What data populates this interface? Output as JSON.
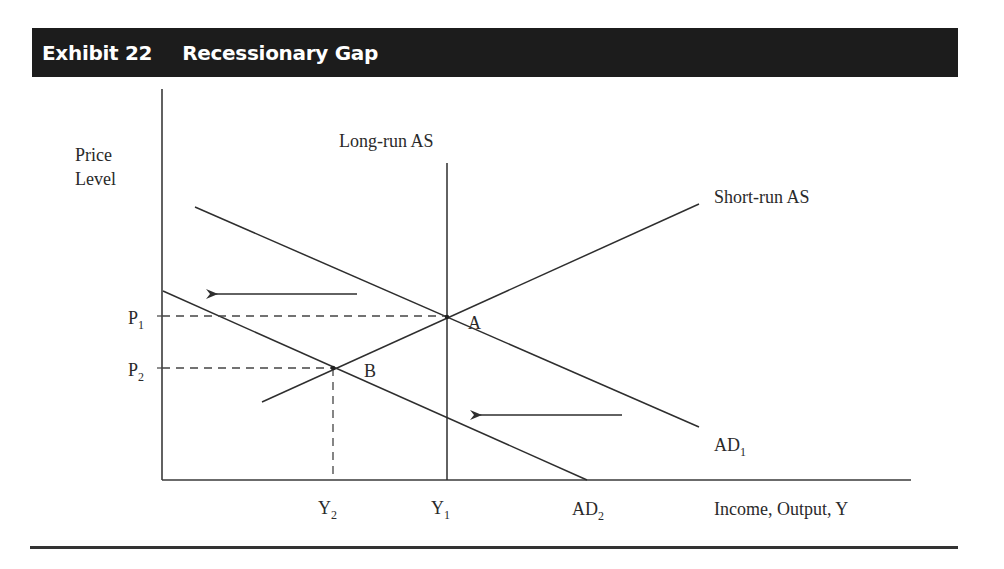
{
  "header": {
    "exhibit_label": "Exhibit 22",
    "title": "Recessionary Gap",
    "background_color": "#1c1c1c",
    "text_color": "#ffffff"
  },
  "axes": {
    "y_label_line1": "Price",
    "y_label_line2": "Level",
    "x_label": "Income, Output, Y"
  },
  "curves": {
    "lras_label": "Long-run AS",
    "sras_label": "Short-run AS",
    "ad1_label": "AD",
    "ad1_sub": "1",
    "ad2_label": "AD",
    "ad2_sub": "2"
  },
  "points": {
    "a_label": "A",
    "b_label": "B"
  },
  "ticks": {
    "p1": "P",
    "p1_sub": "1",
    "p2": "P",
    "p2_sub": "2",
    "y1": "Y",
    "y1_sub": "1",
    "y2": "Y",
    "y2_sub": "2"
  },
  "annotations": {
    "shift_arrows": [
      "AD shifts left (upper arrow)",
      "AD shifts left (lower arrow)"
    ]
  },
  "colors": {
    "line": "#2e2e2e",
    "rule": "#333333"
  }
}
